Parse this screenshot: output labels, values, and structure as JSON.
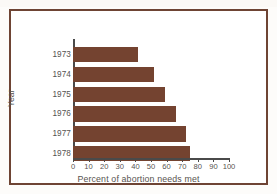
{
  "chart_data": {
    "type": "bar",
    "orientation": "horizontal",
    "title": "",
    "xlabel": "Percent of abortion needs met",
    "ylabel": "Year",
    "categories": [
      "1973",
      "1974",
      "1975",
      "1976",
      "1977",
      "1978"
    ],
    "values": [
      41.5,
      52,
      59,
      66,
      72.5,
      75
    ],
    "xlim": [
      0,
      100
    ],
    "xticks": [
      0,
      10,
      20,
      30,
      40,
      50,
      60,
      70,
      80,
      90,
      100
    ],
    "xticklabels": [
      "0",
      "10",
      "20",
      "30",
      "40",
      "50",
      "60",
      "70",
      "80",
      "90",
      "100"
    ],
    "grid": false,
    "legend": false,
    "bar_color": "#744330",
    "axis_color": "#4a4a4a",
    "text_color": "#57534f",
    "frame_color": "#6e4434",
    "background": "#ffffff"
  }
}
